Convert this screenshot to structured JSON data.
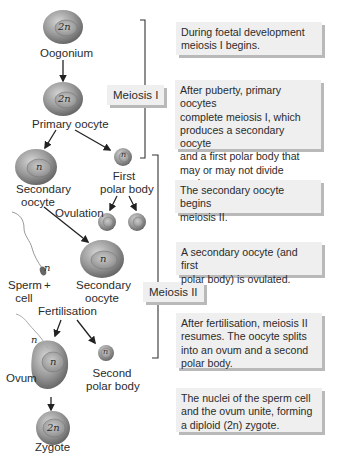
{
  "diagram": {
    "stages": {
      "oogonium": {
        "label": "Oogonium",
        "ploidy": "2n"
      },
      "primary_oocyte": {
        "label": "Primary oocyte",
        "ploidy": "2n"
      },
      "secondary_oocyte": {
        "label_line1": "Secondary",
        "label_line2": "oocyte",
        "ploidy": "n"
      },
      "first_polar_body": {
        "label_line1": "First",
        "label_line2": "polar body",
        "ploidy": "n"
      },
      "ovulation": {
        "label": "Ovulation"
      },
      "sperm_cell": {
        "label_line1": "Sperm",
        "label_line2": "cell",
        "ploidy": "n"
      },
      "plus": "+",
      "secondary_oocyte_ovulated": {
        "label_line1": "Secondary",
        "label_line2": "oocyte",
        "ploidy": "n"
      },
      "fertilisation": {
        "label": "Fertilisation"
      },
      "ovum": {
        "label": "Ovum",
        "ploidy": "n",
        "sperm_ploidy": "n"
      },
      "second_polar_body": {
        "label_line1": "Second",
        "label_line2": "polar body",
        "ploidy": "n"
      },
      "zygote": {
        "label": "Zygote",
        "ploidy": "2n"
      }
    },
    "phases": {
      "meiosis_1": "Meiosis I",
      "meiosis_2": "Meiosis II"
    },
    "notes": [
      {
        "lines": [
          "During foetal development",
          "meiosis I begins."
        ]
      },
      {
        "lines": [
          "After puberty, primary oocytes",
          "complete meiosis I, which",
          "produces a secondary oocyte",
          "and a first polar body that",
          "may or may not divide again."
        ]
      },
      {
        "lines": [
          "The secondary oocyte begins",
          "meiosis II."
        ]
      },
      {
        "lines": [
          "A secondary oocyte (and first",
          "polar body) is ovulated."
        ]
      },
      {
        "lines": [
          "After fertilisation, meiosis II",
          "resumes. The oocyte splits",
          "into an ovum and a second",
          "polar body."
        ]
      },
      {
        "lines": [
          "The nuclei of the sperm cell",
          "and the ovum unite, forming",
          "a diploid (2n) zygote."
        ]
      }
    ],
    "colors": {
      "cell_outer": "#8a8a8a",
      "cell_inner": "#b5b5b5",
      "box_bg": "#efefef",
      "box_shadow": "#b9b9b9",
      "line": "#333333"
    }
  }
}
